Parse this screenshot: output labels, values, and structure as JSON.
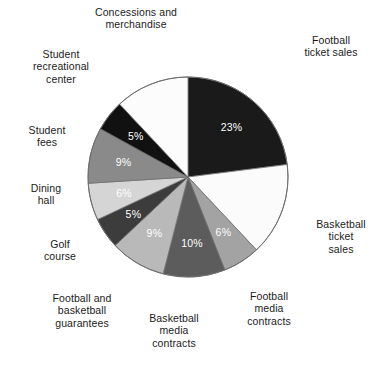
{
  "chart_data": {
    "type": "pie",
    "title": "",
    "subtitle": "",
    "xlabel": "",
    "ylabel": "",
    "legend_position": "callout-labels-around-pie",
    "grid": false,
    "start_angle_deg": 0,
    "direction": "clockwise",
    "value_unit": "%",
    "categories": [
      "Football ticket sales",
      "Basketball ticket sales",
      "Football media contracts",
      "Basketball media contracts",
      "Football and basketball guarantees",
      "Golf course",
      "Dining hall",
      "Student fees",
      "Student recreational center",
      "Concessions and merchandise"
    ],
    "values": [
      23,
      15,
      6,
      10,
      9,
      5,
      6,
      9,
      5,
      12
    ],
    "slices": [
      {
        "label": "Football ticket sales",
        "label_display": "Football\nticket sales",
        "value": 23,
        "value_label": "23%",
        "value_label_visible": true,
        "color": "#1a1a1a",
        "label_text_color": "#ffffff"
      },
      {
        "label": "Basketball ticket sales",
        "label_display": "Basketball\nticket\nsales",
        "value": 15,
        "value_label": "15%",
        "value_label_visible": false,
        "color": "#fbfbfb",
        "label_text_color": "#fbfbfb"
      },
      {
        "label": "Football media contracts",
        "label_display": "Football\nmedia\ncontracts",
        "value": 6,
        "value_label": "6%",
        "value_label_visible": true,
        "color": "#a3a3a3",
        "label_text_color": "#ffffff"
      },
      {
        "label": "Basketball media contracts",
        "label_display": "Basketball\nmedia\ncontracts",
        "value": 10,
        "value_label": "10%",
        "value_label_visible": true,
        "color": "#5c5c5c",
        "label_text_color": "#ffffff"
      },
      {
        "label": "Football and basketball guarantees",
        "label_display": "Football and\nbasketball\nguarantees",
        "value": 9,
        "value_label": "9%",
        "value_label_visible": true,
        "color": "#b9b9b9",
        "label_text_color": "#ffffff"
      },
      {
        "label": "Golf course",
        "label_display": "Golf\ncourse",
        "value": 5,
        "value_label": "5%",
        "value_label_visible": true,
        "color": "#3c3c3c",
        "label_text_color": "#ffffff"
      },
      {
        "label": "Dining hall",
        "label_display": "Dining\nhall",
        "value": 6,
        "value_label": "6%",
        "value_label_visible": true,
        "color": "#d5d5d5",
        "label_text_color": "#ffffff"
      },
      {
        "label": "Student fees",
        "label_display": "Student\nfees",
        "value": 9,
        "value_label": "9%",
        "value_label_visible": true,
        "color": "#8a8a8a",
        "label_text_color": "#ffffff"
      },
      {
        "label": "Student recreational center",
        "label_display": "Student\nrecreational\ncenter",
        "value": 5,
        "value_label": "5%",
        "value_label_visible": true,
        "color": "#111111",
        "label_text_color": "#ffffff"
      },
      {
        "label": "Concessions and merchandise",
        "label_display": "Concessions and\nmerchandise",
        "value": 12,
        "value_label": "12%",
        "value_label_visible": false,
        "color": "#fcfcfc",
        "label_text_color": "#fcfcfc"
      }
    ]
  },
  "callouts": {
    "concessions": "Concessions and\nmerchandise",
    "student_recreational_center": "Student\nrecreational\ncenter",
    "student_fees": "Student\nfees",
    "dining_hall": "Dining\nhall",
    "golf_course": "Golf\ncourse",
    "guarantees": "Football and\nbasketball\nguarantees",
    "basketball_media": "Basketball\nmedia\ncontracts",
    "football_media": "Football\nmedia\ncontracts",
    "basketball_ticket": "Basketball\nticket\nsales",
    "football_ticket": "Football\nticket sales"
  },
  "values": {
    "football_ticket": "23%",
    "basketball_ticket": "15%",
    "football_media": "6%",
    "basketball_media": "10%",
    "guarantees": "9%",
    "golf_course": "5%",
    "dining_hall": "6%",
    "student_fees": "9%",
    "student_recreational_center": "5%",
    "concessions": "12%"
  },
  "geometry": {
    "center_x": 188,
    "center_y": 177,
    "radius": 100
  },
  "colors": {
    "outline": "#6e6e6e",
    "text": "#1b1b1b",
    "background": "#ffffff"
  }
}
